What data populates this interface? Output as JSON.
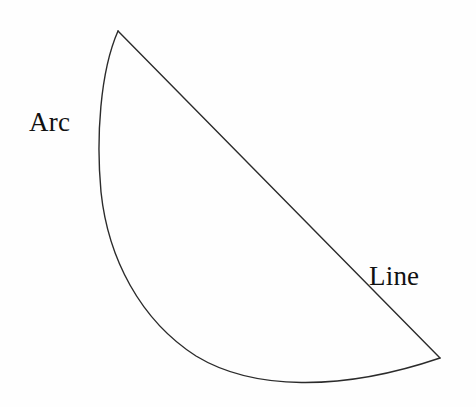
{
  "figure": {
    "background_color": "#fefefe",
    "stroke_color": "#2b2b2b",
    "stroke_width": 1.4,
    "fill_color": "none",
    "width": 476,
    "height": 407
  },
  "labels": {
    "arc": "Arc",
    "line": "Line"
  },
  "label_positions": {
    "arc": {
      "x": 29,
      "y": 109
    },
    "line": {
      "x": 369,
      "y": 263
    }
  },
  "geometry": {
    "vertices": [
      {
        "name": "top-vertex",
        "x": 118,
        "y": 31
      },
      {
        "name": "right-vertex",
        "x": 440,
        "y": 358
      }
    ],
    "line_path": "M 118 31 L 440 358",
    "arc_path": "M 118 31 C 100 72 96 138 101 192 C 108 258 140 320 196 356 C 252 390 340 392 440 358",
    "arc_sample_points": [
      {
        "x": 118,
        "y": 31
      },
      {
        "x": 101,
        "y": 110
      },
      {
        "x": 99,
        "y": 172
      },
      {
        "x": 118,
        "y": 252
      },
      {
        "x": 152,
        "y": 308
      },
      {
        "x": 210,
        "y": 352
      },
      {
        "x": 290,
        "y": 378
      },
      {
        "x": 330,
        "y": 382
      },
      {
        "x": 390,
        "y": 373
      },
      {
        "x": 440,
        "y": 358
      }
    ]
  }
}
